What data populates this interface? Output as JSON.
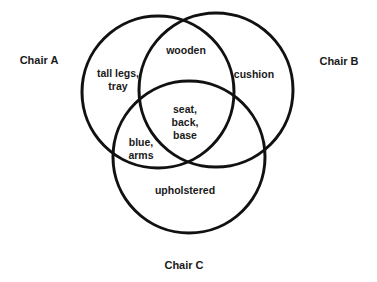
{
  "diagram": {
    "type": "venn-3",
    "line_color": "#111111",
    "background": "#ffffff",
    "sets": [
      {
        "id": "A",
        "label": "Chair A",
        "circle": {
          "cx": 158,
          "cy": 92,
          "r": 76
        },
        "label_pos": {
          "x": 39,
          "y": 60
        }
      },
      {
        "id": "B",
        "label": "Chair B",
        "circle": {
          "cx": 216,
          "cy": 90,
          "r": 77
        },
        "label_pos": {
          "x": 339,
          "y": 61
        }
      },
      {
        "id": "C",
        "label": "Chair C",
        "circle": {
          "cx": 189,
          "cy": 157,
          "r": 76
        },
        "label_pos": {
          "x": 184,
          "y": 265
        }
      }
    ],
    "regions": [
      {
        "sets": [
          "A"
        ],
        "text": "tall legs,\ntray",
        "pos": {
          "x": 118,
          "y": 80
        }
      },
      {
        "sets": [
          "A",
          "B"
        ],
        "text": "wooden",
        "pos": {
          "x": 186,
          "y": 50
        }
      },
      {
        "sets": [
          "B"
        ],
        "text": "cushion",
        "pos": {
          "x": 254,
          "y": 74
        }
      },
      {
        "sets": [
          "A",
          "B",
          "C"
        ],
        "text": "seat,\nback,\nbase",
        "pos": {
          "x": 185,
          "y": 122
        }
      },
      {
        "sets": [
          "A",
          "C"
        ],
        "text": "blue,\narms",
        "pos": {
          "x": 141,
          "y": 149
        }
      },
      {
        "sets": [
          "C"
        ],
        "text": "upholstered",
        "pos": {
          "x": 185,
          "y": 190
        }
      },
      {
        "sets": [
          "B",
          "C"
        ],
        "text": "",
        "pos": {
          "x": 238,
          "y": 140
        }
      }
    ]
  }
}
